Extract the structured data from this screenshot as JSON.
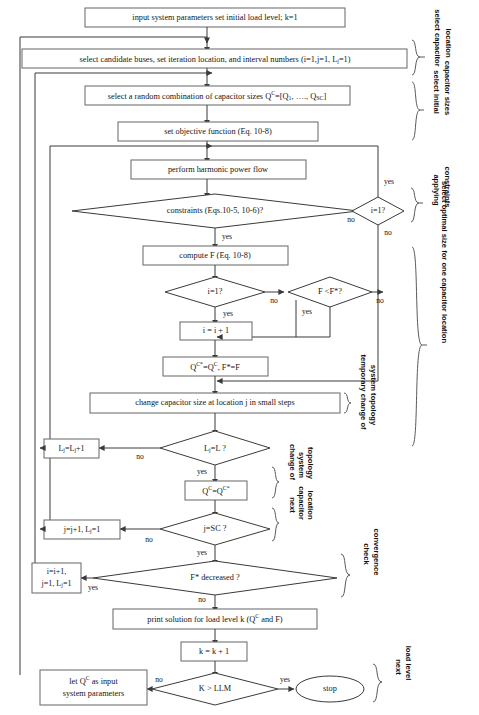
{
  "diagram": {
    "type": "flowchart",
    "colors": {
      "box_stroke": "#6d6d6d",
      "line_stroke": "#3a3a3a",
      "text": "#151515",
      "brace": "#5a5a5a",
      "background": "#ffffff"
    },
    "nodes": {
      "input_params": "input system parameters set initial load level; k=1",
      "select_buses": "select candidate buses, set iteration location, and interval numbers (i=1,j=1, L",
      "select_buses_sub": "j",
      "select_buses_tail": "=1)",
      "random_combination_pre": "select a random combination of capacitor sizes Q",
      "random_combination_sup": "C",
      "random_combination_mid": "=[Q",
      "random_combination_sub1": "1",
      "random_combination_mid2": ", …., Q",
      "random_combination_sub2": "SC",
      "random_combination_tail": "]",
      "objective_function": "set objective function (Eq. 10-8)",
      "harmonic_power_flow": "perform harmonic power flow",
      "constraints": "constraints (Eqs.10-5, 10-6)?",
      "i_equals_1_right": "i=1?",
      "compute_f": "compute F (Eq. 10-8)",
      "i_equals_1_mid": "i=1?",
      "f_less_fstar": "F <F*?",
      "i_increment": "i = i + 1",
      "qc_assign_pre": "Q",
      "qc_assign_sup1": "C*",
      "qc_assign_mid": "=Q",
      "qc_assign_sup2": "C",
      "qc_assign_tail": ", F*=F",
      "change_cap_size": "change capacitor size at location j in small steps",
      "lj_equals_l": "L",
      "lj_equals_l_sub": "j",
      "lj_equals_l_tail": "=L ?",
      "lj_increment_pre": "L",
      "lj_increment_sub1": "j",
      "lj_increment_mid": "=L",
      "lj_increment_sub2": "j",
      "lj_increment_tail": "+1",
      "qc_restore_pre": "Q",
      "qc_restore_sup1": "C",
      "qc_restore_mid": "=Q",
      "qc_restore_sup2": "C*",
      "j_equals_sc": "j=SC ?",
      "j_increment_pre": "j=j+1, L",
      "j_increment_sub": "j",
      "j_increment_tail": "=1",
      "fstar_decreased": "F* decreased ?",
      "i_j_reset_line1": "i=i+1,",
      "i_j_reset_line2_pre": "j=1, L",
      "i_j_reset_line2_sub": "j",
      "i_j_reset_line2_tail": "=1",
      "print_solution_pre": "print solution for load level k (Q",
      "print_solution_sup": "C",
      "print_solution_tail": " and F)",
      "k_increment": "k = k + 1",
      "k_gt_llm": "K > LLM",
      "let_qc_line1_pre": "let Q",
      "let_qc_line1_sup": "C",
      "let_qc_line1_tail": " as input",
      "let_qc_line2": "system parameters",
      "stop": "stop"
    },
    "edge_labels": {
      "constraints_no": "no",
      "constraints_yes": "yes",
      "i1right_yes": "yes",
      "i1right_no": "no",
      "i1mid_no": "no",
      "i1mid_yes": "yes",
      "fstar_no": "no",
      "fstar_yes": "yes",
      "ljl_no": "no",
      "ljl_yes": "yes",
      "jsc_no": "no",
      "jsc_yes": "yes",
      "fdec_yes": "yes",
      "fdec_no": "no",
      "kllm_no": "no",
      "kllm_yes": "yes"
    },
    "group_labels": {
      "select_capacitor_location": [
        "select capacitor",
        "location"
      ],
      "select_initial_capacitor_sizes": [
        "select initial",
        "capacitor sizes"
      ],
      "applying_constraints": [
        "applying",
        "constraints"
      ],
      "select_optimal_size": [
        "select optimal size for one capacitor location"
      ],
      "temporary_change": [
        "temporary change of",
        "system topology"
      ],
      "change_of_system_topology": [
        "change of",
        "system",
        "topology"
      ],
      "next_capacitor_location": [
        "next",
        "capacitor",
        "location"
      ],
      "check_convergence": [
        "check",
        "convergence"
      ],
      "next_load_level": [
        "next",
        "load level"
      ]
    },
    "caption": ""
  }
}
